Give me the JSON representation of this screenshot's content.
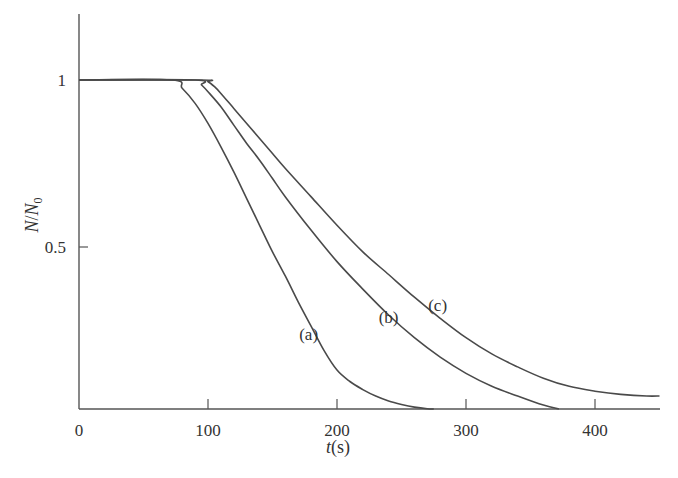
{
  "chart_data": {
    "type": "line",
    "title": "",
    "xlabel": "t(s)",
    "ylabel": "N/N0",
    "xlim": [
      0,
      450
    ],
    "ylim": [
      0,
      1.2
    ],
    "grid": false,
    "legend": "none (inline curve labels)",
    "x_ticks": [
      0,
      100,
      200,
      300,
      400
    ],
    "x_tick_labels": [
      "0",
      "100",
      "200",
      "300",
      "400"
    ],
    "y_ticks": [
      0.5,
      1
    ],
    "y_tick_labels": [
      "0.5",
      "1"
    ],
    "series": [
      {
        "name": "(a)",
        "x": [
          0,
          72,
          80,
          90,
          100,
          110,
          120,
          130,
          140,
          150,
          160,
          170,
          180,
          190,
          200,
          210,
          220,
          230,
          240,
          250,
          260,
          270,
          275
        ],
        "y": [
          1,
          1,
          0.975,
          0.93,
          0.87,
          0.8,
          0.725,
          0.645,
          0.565,
          0.485,
          0.41,
          0.33,
          0.255,
          0.18,
          0.12,
          0.085,
          0.06,
          0.04,
          0.025,
          0.014,
          0.006,
          0.001,
          0
        ]
      },
      {
        "name": "(b)",
        "x": [
          0,
          90,
          95,
          100,
          110,
          120,
          130,
          140,
          150,
          160,
          180,
          200,
          220,
          240,
          260,
          280,
          300,
          320,
          340,
          360,
          372
        ],
        "y": [
          1,
          1,
          0.985,
          0.965,
          0.92,
          0.865,
          0.81,
          0.76,
          0.705,
          0.65,
          0.55,
          0.455,
          0.37,
          0.29,
          0.22,
          0.16,
          0.11,
          0.07,
          0.04,
          0.012,
          0
        ]
      },
      {
        "name": "(c)",
        "x": [
          0,
          95,
          100,
          105,
          110,
          120,
          130,
          140,
          150,
          160,
          180,
          200,
          220,
          240,
          260,
          280,
          300,
          320,
          340,
          360,
          380,
          400,
          420,
          440,
          450
        ],
        "y": [
          1,
          1,
          0.995,
          0.98,
          0.96,
          0.915,
          0.87,
          0.825,
          0.78,
          0.735,
          0.65,
          0.565,
          0.485,
          0.415,
          0.345,
          0.28,
          0.22,
          0.17,
          0.13,
          0.095,
          0.07,
          0.055,
          0.045,
          0.04,
          0.04
        ]
      }
    ],
    "annotations": [
      {
        "text": "(a)",
        "x": 178,
        "y": 0.23
      },
      {
        "text": "(b)",
        "x": 240,
        "y": 0.285
      },
      {
        "text": "(c)",
        "x": 278,
        "y": 0.32
      }
    ]
  }
}
